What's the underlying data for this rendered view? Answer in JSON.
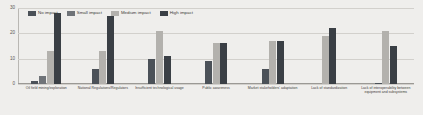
{
  "chart_data": {
    "type": "bar",
    "title": "",
    "xlabel": "",
    "ylabel": "",
    "ylim": [
      0,
      30
    ],
    "yticks": [
      0,
      10,
      20,
      30
    ],
    "grid": true,
    "legend_position": "top-left",
    "categories": [
      "Oil field mining/exploration",
      "National Regulations/Regulators",
      "Insufficient technological usage",
      "Public awareness",
      "Market stakeholders' adaptation",
      "Lack of standardization",
      "Lack of interoperability between equipment and subsystems"
    ],
    "series": [
      {
        "name": "No impact",
        "color": "#4b5158",
        "values": [
          1,
          6,
          10,
          9,
          6,
          0,
          0.5
        ]
      },
      {
        "name": "Small impact",
        "color": "#6f7378",
        "values": [
          3,
          0,
          0,
          0,
          0,
          0,
          0
        ]
      },
      {
        "name": "Medium impact",
        "color": "#b3b1ad",
        "values": [
          13,
          13,
          21,
          16,
          17,
          19,
          21
        ]
      },
      {
        "name": "High impact",
        "color": "#3a3f45",
        "values": [
          28,
          27,
          11,
          16,
          17,
          22,
          15
        ]
      }
    ]
  },
  "legend": {
    "items": [
      {
        "label": "No impact"
      },
      {
        "label": "Small impact"
      },
      {
        "label": "Medium impact"
      },
      {
        "label": "High impact"
      }
    ]
  },
  "axis": {
    "ytick_labels": [
      "0",
      "10",
      "20",
      "30"
    ]
  }
}
